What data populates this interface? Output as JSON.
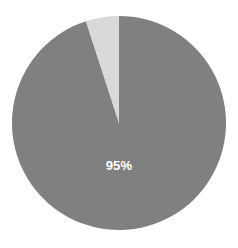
{
  "chart_data": {
    "type": "pie",
    "title": "",
    "subtitle": "",
    "xlabel": "",
    "ylabel": "",
    "legend": false,
    "grid": false,
    "background_color": "#ffffff",
    "center": {
      "x": 119,
      "y": 123
    },
    "radius": 107,
    "start_angle_deg": 90,
    "direction": "clockwise",
    "categories": [
      "Majority",
      "Remainder"
    ],
    "values": [
      95,
      5
    ],
    "colors": [
      "#808080",
      "#d9d9d9"
    ],
    "slices": [
      {
        "name": "Majority",
        "value": 95,
        "color": "#808080",
        "label": "95%",
        "label_color": "#ffffff",
        "label_x": 119,
        "label_y": 167,
        "show_label": true
      },
      {
        "name": "Remainder",
        "value": 5,
        "color": "#d9d9d9",
        "label": "",
        "show_label": false
      }
    ]
  },
  "chart": {
    "main_slice_label": "95%"
  }
}
